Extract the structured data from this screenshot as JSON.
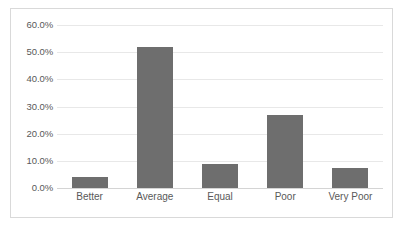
{
  "chart_data": {
    "type": "bar",
    "title": "",
    "subtitle": "",
    "xlabel": "",
    "ylabel": "",
    "categories": [
      "Better",
      "Average",
      "Equal",
      "Poor",
      "Very Poor"
    ],
    "values": [
      4.0,
      52.0,
      9.0,
      27.0,
      7.5
    ],
    "value_labels": [
      "",
      "",
      "",
      "",
      ""
    ],
    "ylim": [
      0,
      60
    ],
    "ytick_values": [
      0,
      10,
      20,
      30,
      40,
      50,
      60
    ],
    "ytick_labels": [
      "0.0%",
      "10.0%",
      "20.0%",
      "30.0%",
      "40.0%",
      "50.0%",
      "60.0%"
    ],
    "grid": true,
    "grid_axis": "y",
    "legend": false,
    "legend_position": "none",
    "series": [
      {
        "name": "",
        "values": [
          4.0,
          52.0,
          9.0,
          27.0,
          7.5
        ]
      }
    ]
  },
  "style": {
    "bar_color": "#6e6e6e",
    "gridline_color": "#e8e8e8",
    "baseline_color": "#d4d4d4",
    "border_color": "#d9d9d9",
    "text_color": "#595959",
    "background_color": "#ffffff"
  }
}
